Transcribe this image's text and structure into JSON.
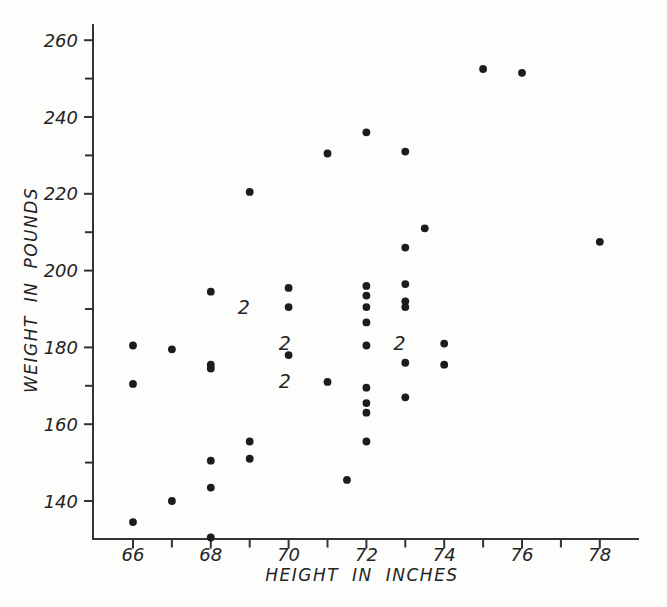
{
  "chart_data": {
    "type": "scatter",
    "title": "",
    "xlabel": "HEIGHT IN INCHES",
    "ylabel": "WEIGHT IN POUNDS",
    "xlim": [
      64.9,
      79
    ],
    "ylim": [
      130,
      264
    ],
    "grid": false,
    "legend": null,
    "marker": "filled-circle",
    "ink_color": "#242424",
    "background_color": "#fdfdfc",
    "x_major_ticks": [
      66,
      68,
      70,
      72,
      74,
      76,
      78
    ],
    "x_minor_ticks": [
      67,
      69,
      71,
      73,
      75,
      77
    ],
    "y_major_ticks": [
      140,
      160,
      180,
      200,
      220,
      240,
      260
    ],
    "y_minor_ticks": [
      150,
      170,
      190,
      210,
      230,
      250
    ],
    "points": [
      {
        "x": 75,
        "y": 252.5
      },
      {
        "x": 76,
        "y": 251.5
      },
      {
        "x": 72,
        "y": 236
      },
      {
        "x": 73,
        "y": 231
      },
      {
        "x": 71,
        "y": 230.5
      },
      {
        "x": 69,
        "y": 220.5
      },
      {
        "x": 73.5,
        "y": 211
      },
      {
        "x": 78,
        "y": 207.5
      },
      {
        "x": 73,
        "y": 206
      },
      {
        "x": 73,
        "y": 196.5
      },
      {
        "x": 72,
        "y": 196
      },
      {
        "x": 70,
        "y": 195.5
      },
      {
        "x": 68,
        "y": 194.5
      },
      {
        "x": 72,
        "y": 193.5
      },
      {
        "x": 73,
        "y": 192
      },
      {
        "x": 73,
        "y": 190.5
      },
      {
        "x": 72,
        "y": 190.5
      },
      {
        "x": 70,
        "y": 190.5
      },
      {
        "x": 72,
        "y": 186.5
      },
      {
        "x": 74,
        "y": 181
      },
      {
        "x": 66,
        "y": 180.5
      },
      {
        "x": 72,
        "y": 180.5
      },
      {
        "x": 67,
        "y": 179.5
      },
      {
        "x": 70,
        "y": 178
      },
      {
        "x": 73,
        "y": 176
      },
      {
        "x": 68,
        "y": 175.5
      },
      {
        "x": 74,
        "y": 175.5
      },
      {
        "x": 68,
        "y": 174.5
      },
      {
        "x": 71,
        "y": 171
      },
      {
        "x": 66,
        "y": 170.5
      },
      {
        "x": 72,
        "y": 169.5
      },
      {
        "x": 73,
        "y": 167
      },
      {
        "x": 72,
        "y": 165.5
      },
      {
        "x": 72,
        "y": 163
      },
      {
        "x": 72,
        "y": 155.5
      },
      {
        "x": 69,
        "y": 155.5
      },
      {
        "x": 69,
        "y": 151
      },
      {
        "x": 68,
        "y": 150.5
      },
      {
        "x": 71.5,
        "y": 145.5
      },
      {
        "x": 68,
        "y": 143.5
      },
      {
        "x": 67,
        "y": 140
      },
      {
        "x": 66,
        "y": 134.5
      },
      {
        "x": 68,
        "y": 130.5
      }
    ],
    "multiplicity_labels": [
      {
        "text": "2",
        "x": 68.85,
        "y": 190.5
      },
      {
        "text": "2",
        "x": 69.9,
        "y": 181
      },
      {
        "text": "2",
        "x": 69.9,
        "y": 171
      },
      {
        "text": "2",
        "x": 72.85,
        "y": 181
      }
    ]
  }
}
